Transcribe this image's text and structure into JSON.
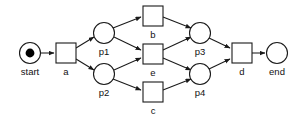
{
  "diagram": {
    "type": "petri-net",
    "colors": {
      "background": "#ffffff",
      "stroke": "#1a1a1a",
      "token": "#000000",
      "label": "#111111"
    },
    "places": [
      {
        "id": "start",
        "label": "start",
        "cx": 30,
        "cy": 53,
        "r": 10.5,
        "tokens": 1,
        "label_x": 30,
        "label_y": 75
      },
      {
        "id": "p1",
        "label": "p1",
        "cx": 104,
        "cy": 33,
        "r": 10.5,
        "tokens": 0,
        "label_x": 104,
        "label_y": 55
      },
      {
        "id": "p2",
        "label": "p2",
        "cx": 104,
        "cy": 74,
        "r": 10.5,
        "tokens": 0,
        "label_x": 104,
        "label_y": 96
      },
      {
        "id": "p3",
        "label": "p3",
        "cx": 200,
        "cy": 33,
        "r": 10.5,
        "tokens": 0,
        "label_x": 200,
        "label_y": 55
      },
      {
        "id": "p4",
        "label": "p4",
        "cx": 200,
        "cy": 74,
        "r": 10.5,
        "tokens": 0,
        "label_x": 200,
        "label_y": 96
      },
      {
        "id": "end",
        "label": "end",
        "cx": 277,
        "cy": 53,
        "r": 10.5,
        "tokens": 0,
        "label_x": 277,
        "label_y": 75
      }
    ],
    "transitions": [
      {
        "id": "a",
        "label": "a",
        "x": 56,
        "y": 43,
        "w": 20,
        "h": 20,
        "label_x": 66,
        "label_y": 75
      },
      {
        "id": "b",
        "label": "b",
        "x": 143,
        "y": 6,
        "w": 20,
        "h": 20,
        "label_x": 153,
        "label_y": 38
      },
      {
        "id": "e",
        "label": "e",
        "x": 143,
        "y": 44,
        "w": 20,
        "h": 20,
        "label_x": 153,
        "label_y": 76
      },
      {
        "id": "c",
        "label": "c",
        "x": 143,
        "y": 82,
        "w": 20,
        "h": 20,
        "label_x": 153,
        "label_y": 114
      },
      {
        "id": "d",
        "label": "d",
        "x": 232,
        "y": 43,
        "w": 20,
        "h": 20,
        "label_x": 242,
        "label_y": 75
      }
    ],
    "arcs": [
      {
        "id": "start-a",
        "from": "start",
        "to": "a",
        "x1": 41,
        "y1": 53,
        "x2": 54,
        "y2": 53
      },
      {
        "id": "a-p1",
        "from": "a",
        "to": "p1",
        "x1": 76,
        "y1": 48,
        "x2": 94,
        "y2": 37
      },
      {
        "id": "a-p2",
        "from": "a",
        "to": "p2",
        "x1": 76,
        "y1": 59,
        "x2": 94,
        "y2": 70
      },
      {
        "id": "p1-b",
        "from": "p1",
        "to": "b",
        "x1": 113,
        "y1": 28,
        "x2": 141,
        "y2": 17
      },
      {
        "id": "p1-e",
        "from": "p1",
        "to": "e",
        "x1": 114,
        "y1": 37,
        "x2": 141,
        "y2": 50
      },
      {
        "id": "p2-e",
        "from": "p2",
        "to": "e",
        "x1": 114,
        "y1": 70,
        "x2": 141,
        "y2": 58
      },
      {
        "id": "p2-c",
        "from": "p2",
        "to": "c",
        "x1": 113,
        "y1": 79,
        "x2": 141,
        "y2": 90
      },
      {
        "id": "b-p3",
        "from": "b",
        "to": "p3",
        "x1": 163,
        "y1": 17,
        "x2": 191,
        "y2": 28
      },
      {
        "id": "e-p3",
        "from": "e",
        "to": "p3",
        "x1": 163,
        "y1": 50,
        "x2": 191,
        "y2": 37
      },
      {
        "id": "e-p4",
        "from": "e",
        "to": "p4",
        "x1": 163,
        "y1": 58,
        "x2": 191,
        "y2": 70
      },
      {
        "id": "c-p4",
        "from": "c",
        "to": "p4",
        "x1": 163,
        "y1": 90,
        "x2": 191,
        "y2": 79
      },
      {
        "id": "p3-d",
        "from": "p3",
        "to": "d",
        "x1": 209,
        "y1": 38,
        "x2": 230,
        "y2": 48
      },
      {
        "id": "p4-d",
        "from": "p4",
        "to": "d",
        "x1": 209,
        "y1": 69,
        "x2": 230,
        "y2": 59
      },
      {
        "id": "d-end",
        "from": "d",
        "to": "end",
        "x1": 252,
        "y1": 53,
        "x2": 265,
        "y2": 53
      }
    ]
  }
}
